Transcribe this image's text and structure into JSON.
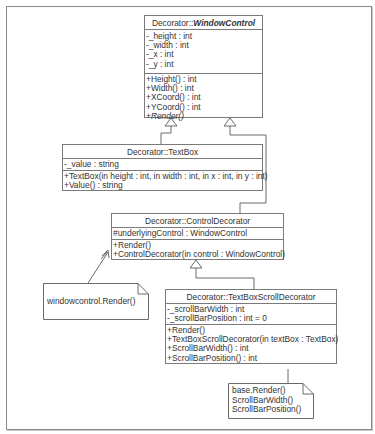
{
  "classes": {
    "window_control": {
      "namespace": "Decorator::",
      "name": "WindowControl",
      "attributes": [
        "-_height : int",
        "-_width : int",
        "-_x : int",
        "-_y : int"
      ],
      "methods": [
        "+Height() : int",
        "+Width() : int",
        "+XCoord() : int",
        "+YCoord() : int",
        "+Render()"
      ]
    },
    "text_box": {
      "title": "Decorator::TextBox",
      "attributes": [
        "-_value : string"
      ],
      "methods": [
        "+TextBox(in height : int, in width : int, in x : int, in y : int)",
        "+Value() : string"
      ]
    },
    "control_decorator": {
      "title": "Decorator::ControlDecorator",
      "attributes": [
        "#underlyingControl : WindowControl"
      ],
      "methods": [
        "+Render()",
        "+ControlDecorator(in control : WindowControl)"
      ]
    },
    "text_box_scroll_decorator": {
      "title": "Decorator::TextBoxScrollDecorator",
      "attributes": [
        "-_scrollBarWidth : int",
        "-_scrollBarPosition : int = 0"
      ],
      "methods": [
        "+Render()",
        "+TextBoxScrollDecorator(in textBox : TextBox)",
        "+ScrollBarWidth() : int",
        "+ScrollBarPosition() : int"
      ]
    }
  },
  "notes": {
    "control_decorator_note": [
      "windowcontrol.Render()"
    ],
    "scroll_decorator_note": [
      "base.Render()",
      "ScrollBarWidth()",
      "ScrollBarPosition()"
    ]
  },
  "colors": {
    "line": "#7a7a7a",
    "text": "#333333",
    "background": "#ffffff"
  }
}
